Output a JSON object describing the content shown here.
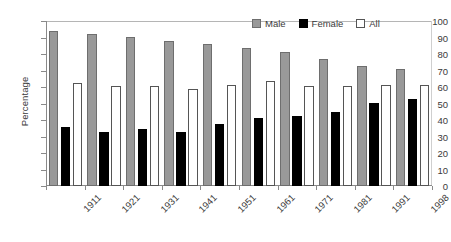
{
  "chart_data": {
    "type": "bar",
    "title": "",
    "xlabel": "",
    "ylabel": "Percentage",
    "ylim": [
      0,
      100
    ],
    "ytick_step": 10,
    "yticks": [
      0,
      10,
      20,
      30,
      40,
      50,
      60,
      70,
      80,
      90,
      100
    ],
    "grid": false,
    "legend_position": "top-right",
    "categories": [
      "1911",
      "1921",
      "1931",
      "1941",
      "1951",
      "1961",
      "1971",
      "1981",
      "1991",
      "1998"
    ],
    "series": [
      {
        "name": "Male",
        "color": "#999999",
        "values": [
          94,
          92,
          90.5,
          88,
          86,
          83.5,
          81,
          77,
          72.5,
          71
        ]
      },
      {
        "name": "Female",
        "color": "#000000",
        "values": [
          35.5,
          33,
          34.5,
          32.5,
          37.5,
          41.5,
          42.5,
          45,
          50.5,
          53
        ]
      },
      {
        "name": "All",
        "color": "#ffffff",
        "values": [
          62.5,
          60.5,
          60.5,
          59,
          61.5,
          63.5,
          60.5,
          60.5,
          61,
          61.5
        ]
      }
    ]
  },
  "legend": {
    "items": [
      {
        "label": "Male"
      },
      {
        "label": "Female"
      },
      {
        "label": "All"
      }
    ]
  }
}
